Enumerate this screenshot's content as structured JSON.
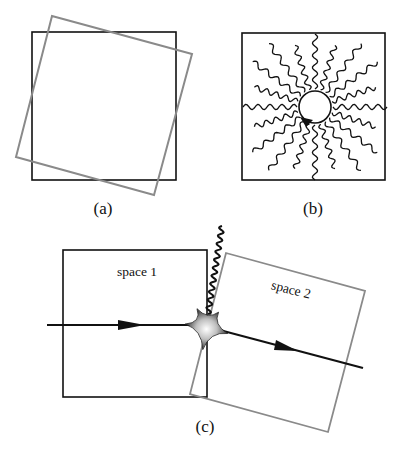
{
  "figure": {
    "panels": [
      {
        "id": "a",
        "label": "(a)",
        "description": "Black square overlaid with a gray square rotated by about 15 degrees"
      },
      {
        "id": "b",
        "label": "(b)",
        "description": "Square containing a small circle with an arrow, surrounded by 20 radial wavy lines"
      },
      {
        "id": "c",
        "label": "(c)",
        "description": "Two adjacent spaces (one upright, one rotated) with a particle path passing through a starburst emission event",
        "spaces": [
          {
            "label": "space 1"
          },
          {
            "label": "space 2"
          }
        ]
      }
    ]
  },
  "colors": {
    "ink": "#111111",
    "rotated_frame": "#8a8a8a",
    "background": "#ffffff"
  }
}
